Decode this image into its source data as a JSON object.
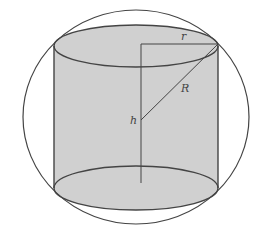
{
  "diagram": {
    "colors": {
      "background": "#ffffff",
      "fill": "#d0d0d0",
      "stroke": "#444444"
    },
    "sphere": {
      "cx": 136,
      "cy": 117,
      "rx": 113,
      "ry": 107
    },
    "cylinder": {
      "left": 54,
      "right": 218,
      "top_ellipse": {
        "cx": 136,
        "cy": 46,
        "rx": 82,
        "ry": 21
      },
      "bottom_ellipse": {
        "cx": 136,
        "cy": 188,
        "rx": 82,
        "ry": 22
      }
    },
    "lines": {
      "axis": {
        "x1": 141,
        "y1": 44,
        "x2": 141,
        "y2": 183
      },
      "radius_r": {
        "x1": 141,
        "y1": 44,
        "x2": 218,
        "y2": 44
      },
      "radius_R": {
        "x1": 141,
        "y1": 120,
        "x2": 218,
        "y2": 44
      }
    },
    "labels": {
      "r": {
        "text": "r",
        "x": 181,
        "y": 40
      },
      "R": {
        "text": "R",
        "x": 181,
        "y": 92
      },
      "h": {
        "text": "h",
        "x": 130,
        "y": 124
      }
    }
  }
}
